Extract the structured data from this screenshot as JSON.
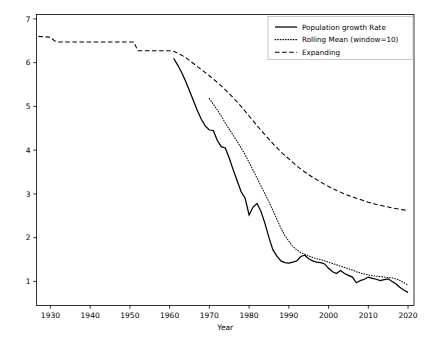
{
  "chart_data": {
    "type": "line",
    "title": "",
    "xlabel": "Year",
    "ylabel": "",
    "xlim": [
      1926.5,
      2021.5
    ],
    "ylim": [
      0.45,
      7.1
    ],
    "grid": false,
    "legend_position": "upper right",
    "xticks": [
      1930,
      1940,
      1950,
      1960,
      1970,
      1980,
      1990,
      2000,
      2010,
      2020
    ],
    "xticklabels": [
      "1930",
      "1940",
      "1950",
      "1960",
      "1970",
      "1980",
      "1990",
      "2000",
      "2010",
      "2020"
    ],
    "yticks": [
      1,
      2,
      3,
      4,
      5,
      6,
      7
    ],
    "yticklabels": [
      "1",
      "2",
      "3",
      "4",
      "5",
      "6",
      "7"
    ],
    "series": [
      {
        "name": "Population growth Rate",
        "style": "solid",
        "color": "#000000",
        "x": [
          1961,
          1962,
          1963,
          1964,
          1965,
          1966,
          1967,
          1968,
          1969,
          1970,
          1971,
          1972,
          1973,
          1974,
          1975,
          1976,
          1977,
          1978,
          1979,
          1980,
          1981,
          1982,
          1983,
          1984,
          1985,
          1986,
          1987,
          1988,
          1989,
          1990,
          1991,
          1992,
          1993,
          1994,
          1995,
          1996,
          1997,
          1998,
          1999,
          2000,
          2001,
          2002,
          2003,
          2004,
          2005,
          2006,
          2007,
          2008,
          2009,
          2010,
          2011,
          2012,
          2013,
          2014,
          2015,
          2016,
          2017,
          2018,
          2019,
          2020
        ],
        "values": [
          6.1,
          5.95,
          5.78,
          5.58,
          5.36,
          5.13,
          4.9,
          4.7,
          4.55,
          4.46,
          4.45,
          4.22,
          4.08,
          4.05,
          3.82,
          3.55,
          3.3,
          3.05,
          2.9,
          2.52,
          2.7,
          2.78,
          2.6,
          2.32,
          2.0,
          1.72,
          1.58,
          1.47,
          1.43,
          1.42,
          1.44,
          1.47,
          1.57,
          1.6,
          1.52,
          1.47,
          1.44,
          1.43,
          1.4,
          1.3,
          1.22,
          1.18,
          1.25,
          1.18,
          1.14,
          1.1,
          0.97,
          1.02,
          1.05,
          1.1,
          1.07,
          1.05,
          1.02,
          1.04,
          1.06,
          1.0,
          0.94,
          0.86,
          0.8,
          0.75
        ]
      },
      {
        "name": "Rolling Mean (window=10)",
        "style": "dotted",
        "color": "#444444",
        "x": [
          1970,
          1971,
          1972,
          1973,
          1974,
          1975,
          1976,
          1977,
          1978,
          1979,
          1980,
          1981,
          1982,
          1983,
          1984,
          1985,
          1986,
          1987,
          1988,
          1989,
          1990,
          1991,
          1992,
          1993,
          1994,
          1995,
          1996,
          1997,
          1998,
          1999,
          2000,
          2001,
          2002,
          2003,
          2004,
          2005,
          2006,
          2007,
          2008,
          2009,
          2010,
          2011,
          2012,
          2013,
          2014,
          2015,
          2016,
          2017,
          2018,
          2019,
          2020
        ],
        "values": [
          5.18,
          5.05,
          4.92,
          4.78,
          4.62,
          4.48,
          4.34,
          4.2,
          4.05,
          3.9,
          3.72,
          3.54,
          3.36,
          3.18,
          3.0,
          2.82,
          2.62,
          2.42,
          2.22,
          2.05,
          1.92,
          1.8,
          1.72,
          1.66,
          1.62,
          1.58,
          1.55,
          1.52,
          1.5,
          1.47,
          1.44,
          1.41,
          1.38,
          1.35,
          1.32,
          1.29,
          1.26,
          1.22,
          1.19,
          1.17,
          1.15,
          1.13,
          1.12,
          1.11,
          1.1,
          1.09,
          1.08,
          1.06,
          1.02,
          0.97,
          0.92
        ]
      },
      {
        "name": "Expanding",
        "style": "dashed",
        "color": "#333333",
        "x": [
          1927,
          1930,
          1931,
          1932,
          1935,
          1940,
          1945,
          1950,
          1951,
          1952,
          1955,
          1960,
          1961,
          1962,
          1964,
          1966,
          1968,
          1970,
          1972,
          1974,
          1976,
          1978,
          1980,
          1982,
          1984,
          1986,
          1988,
          1990,
          1992,
          1994,
          1996,
          1998,
          2000,
          2002,
          2004,
          2006,
          2008,
          2010,
          2012,
          2014,
          2016,
          2018,
          2020
        ],
        "values": [
          6.6,
          6.58,
          6.5,
          6.47,
          6.47,
          6.47,
          6.47,
          6.47,
          6.47,
          6.27,
          6.27,
          6.27,
          6.26,
          6.22,
          6.12,
          5.98,
          5.84,
          5.7,
          5.55,
          5.38,
          5.2,
          5.0,
          4.78,
          4.56,
          4.35,
          4.15,
          3.96,
          3.8,
          3.64,
          3.5,
          3.38,
          3.27,
          3.17,
          3.08,
          3.0,
          2.93,
          2.87,
          2.81,
          2.76,
          2.72,
          2.68,
          2.65,
          2.62
        ]
      }
    ]
  },
  "legend": {
    "entries": [
      {
        "label": "Population growth Rate"
      },
      {
        "label": "Rolling Mean (window=10)"
      },
      {
        "label": "Expanding"
      }
    ]
  },
  "axes": {
    "xlabel": "Year"
  }
}
